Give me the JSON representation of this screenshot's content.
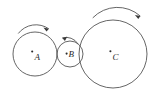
{
  "figure": {
    "background_color": "#ffffff",
    "stroke_color": "#555555",
    "label_color": "#2b2b2b",
    "width": 163,
    "height": 100
  },
  "diagram_data": {
    "type": "diagram",
    "description": "Three mutually tangent circles in a horizontal row, each marked with a center point and an italic letter label, each with a curved rotation arrow above it.",
    "circles": [
      {
        "id": "A",
        "label": "A",
        "center_x": 35,
        "center_y": 54,
        "radius": 22,
        "size": "medium",
        "center_dot": true,
        "label_offset_x": 3,
        "label_offset_y": 6,
        "rotation": "clockwise",
        "arrow_direction": "right"
      },
      {
        "id": "B",
        "label": "B",
        "center_x": 70,
        "center_y": 54,
        "radius": 13,
        "size": "small",
        "center_dot": true,
        "label_offset_x": 3,
        "label_offset_y": 3,
        "rotation": "counterclockwise",
        "arrow_direction": "left"
      },
      {
        "id": "C",
        "label": "C",
        "center_x": 113,
        "center_y": 54,
        "radius": 34,
        "size": "large",
        "center_dot": true,
        "label_offset_x": 4,
        "label_offset_y": 6,
        "rotation": "clockwise",
        "arrow_direction": "right"
      }
    ],
    "tangencies": [
      {
        "from": "A",
        "to": "B",
        "point_x": 57,
        "point_y": 54
      },
      {
        "from": "B",
        "to": "C",
        "point_x": 83,
        "point_y": 54
      }
    ],
    "arrows": [
      {
        "for_circle": "A",
        "label": "rotation-arrow-a",
        "direction": "clockwise"
      },
      {
        "for_circle": "B",
        "label": "rotation-arrow-b",
        "direction": "counterclockwise"
      },
      {
        "for_circle": "C",
        "label": "rotation-arrow-c",
        "direction": "clockwise"
      }
    ]
  }
}
